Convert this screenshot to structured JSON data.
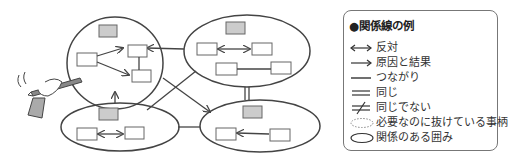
{
  "diagram": {
    "groups": [
      {
        "name": "top-left",
        "cx": 115,
        "cy": 63,
        "rx": 48,
        "ry": 46
      },
      {
        "name": "top-right",
        "cx": 247,
        "cy": 51,
        "rx": 63,
        "ry": 36
      },
      {
        "name": "bottom-left",
        "cx": 120,
        "cy": 127,
        "rx": 59,
        "ry": 24
      },
      {
        "name": "bottom-right",
        "cx": 260,
        "cy": 126,
        "rx": 60,
        "ry": 26
      }
    ],
    "colors": {
      "line": "#444444",
      "box_fill": "#ffffff",
      "header_box_fill": "#cccccc"
    }
  },
  "legend": {
    "title": "●関係線の例",
    "items": [
      {
        "symbol": "double-arrow",
        "label": "反対"
      },
      {
        "symbol": "arrow",
        "label": "原因と結果"
      },
      {
        "symbol": "line",
        "label": "つながり"
      },
      {
        "symbol": "double-line",
        "label": "同じ"
      },
      {
        "symbol": "not-equal",
        "label": "同じでない"
      },
      {
        "symbol": "dotted-ellipse",
        "label": "必要なのに抜けている事柄"
      },
      {
        "symbol": "ellipse",
        "label": "関係のある囲み"
      }
    ]
  }
}
